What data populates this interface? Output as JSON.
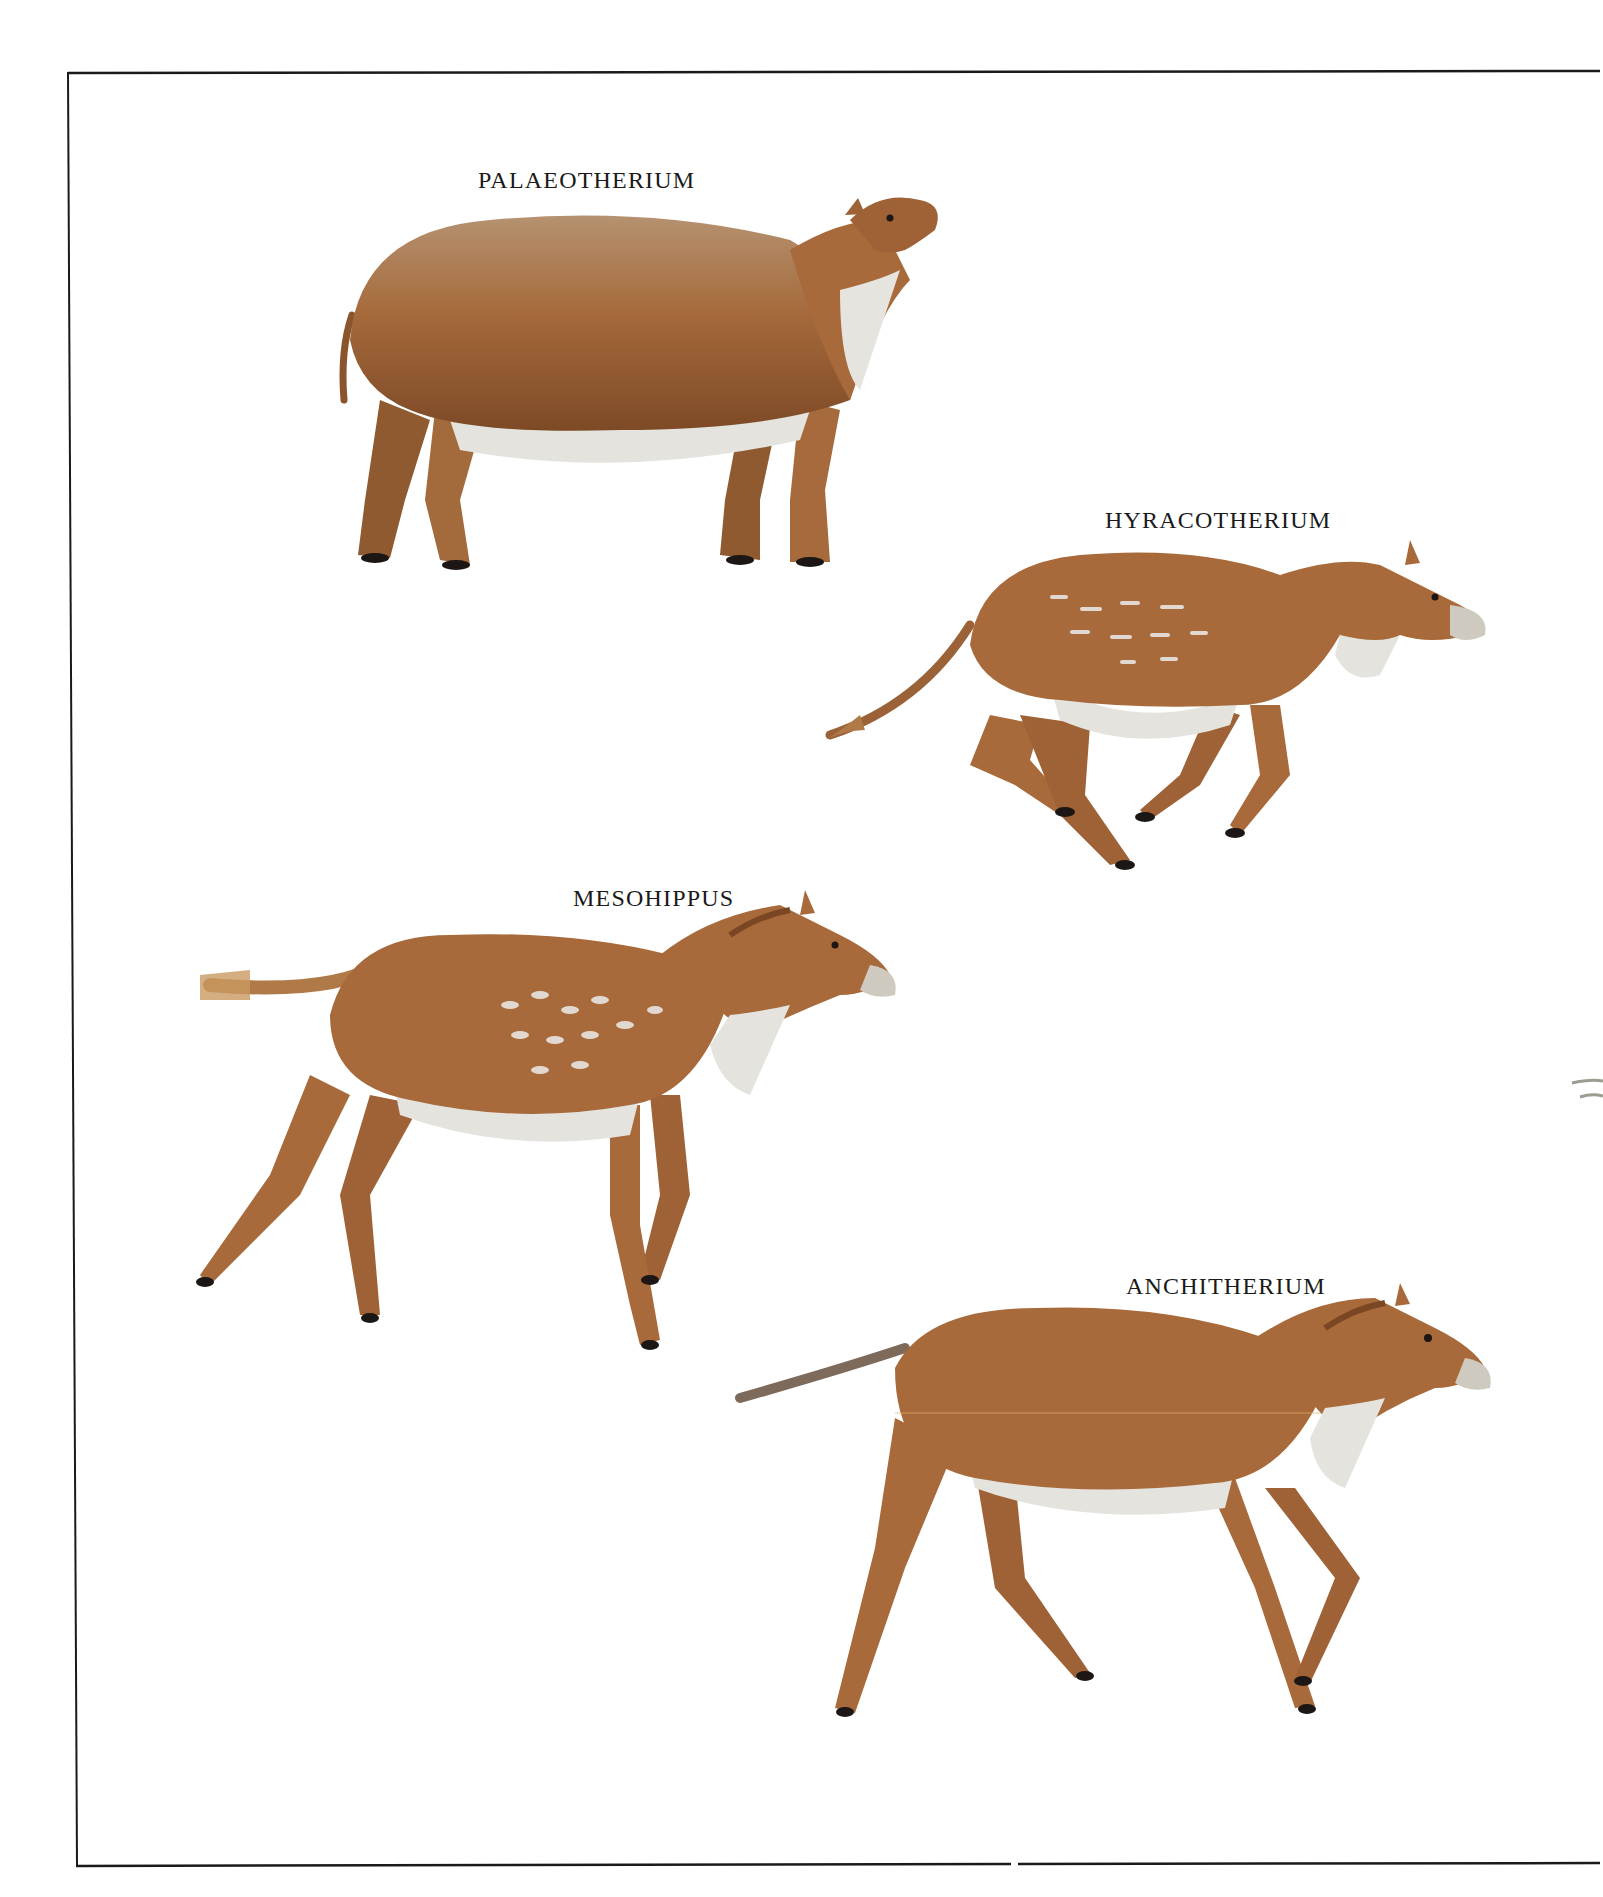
{
  "plate": {
    "colors": {
      "background": "#ffffff",
      "frame": "#1a1a1a",
      "coat": "#a8683a",
      "coat_dark": "#7a4623",
      "coat_light": "#c98d58",
      "belly": "#e4e3de",
      "hoof": "#1c1714",
      "spots": "#e8e6e2"
    },
    "animals": [
      {
        "label": "PALAEOTHERIUM"
      },
      {
        "label": "HYRACOTHERIUM"
      },
      {
        "label": "MESOHIPPUS"
      },
      {
        "label": "ANCHITHERIUM"
      }
    ]
  }
}
